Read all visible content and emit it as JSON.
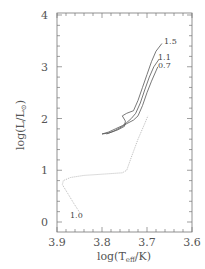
{
  "chart_data": {
    "type": "line",
    "title": "",
    "xlabel": "log(T_eff/K)",
    "ylabel": "log(L/L_sun)",
    "xlim": [
      3.9,
      3.6
    ],
    "ylim": [
      0,
      4
    ],
    "x_reversed": true,
    "grid": false,
    "x_ticks": [
      3.9,
      3.8,
      3.7,
      3.6
    ],
    "x_tick_labels": [
      "3.9",
      "3.8",
      "3.7",
      "3.6"
    ],
    "y_ticks": [
      0,
      1,
      2,
      3,
      4
    ],
    "y_tick_labels": [
      "0",
      "1",
      "2",
      "3",
      "4"
    ],
    "series": [
      {
        "name": "1.0",
        "style": "dotted",
        "color": "#bbbbbb",
        "x": [
          3.847,
          3.862,
          3.876,
          3.888,
          3.886,
          3.87,
          3.84,
          3.79,
          3.755,
          3.745,
          3.735,
          3.72,
          3.705,
          3.698
        ],
        "y": [
          0.15,
          0.35,
          0.55,
          0.72,
          0.8,
          0.86,
          0.9,
          0.93,
          0.95,
          1.0,
          1.25,
          1.6,
          1.9,
          2.05
        ]
      },
      {
        "name": "0.7",
        "style": "solid",
        "color": "#555555",
        "x": [
          3.79,
          3.775,
          3.76,
          3.745,
          3.73,
          3.72,
          3.71,
          3.7,
          3.69,
          3.68,
          3.676
        ],
        "y": [
          1.7,
          1.75,
          1.82,
          1.9,
          1.97,
          2.05,
          2.25,
          2.5,
          2.72,
          2.92,
          3.0
        ]
      },
      {
        "name": "1.1",
        "style": "solid",
        "color": "#555555",
        "x": [
          3.8,
          3.785,
          3.77,
          3.755,
          3.745,
          3.735,
          3.725,
          3.715,
          3.705,
          3.695,
          3.685,
          3.673
        ],
        "y": [
          1.7,
          1.74,
          1.8,
          1.86,
          1.92,
          2.0,
          2.1,
          2.3,
          2.55,
          2.8,
          3.0,
          3.15
        ]
      },
      {
        "name": "1.5",
        "style": "solid",
        "color": "#555555",
        "x": [
          3.8,
          3.785,
          3.765,
          3.75,
          3.748,
          3.755,
          3.745,
          3.73,
          3.72,
          3.71,
          3.7,
          3.69,
          3.68,
          3.667
        ],
        "y": [
          1.7,
          1.72,
          1.78,
          1.85,
          1.95,
          2.05,
          2.1,
          2.15,
          2.35,
          2.6,
          2.85,
          3.1,
          3.3,
          3.45
        ]
      }
    ],
    "annotations": [
      {
        "text": "1.5",
        "x": 3.662,
        "y": 3.48
      },
      {
        "text": "1.1",
        "x": 3.668,
        "y": 3.18
      },
      {
        "text": "0.7",
        "x": 3.669,
        "y": 2.98
      },
      {
        "text": "1.0",
        "x": 3.856,
        "y": 0.18
      }
    ]
  },
  "labels": {
    "x_axis": "log(T",
    "x_sub": "eff",
    "x_tail": "/K)",
    "y_axis": "log(L/L",
    "y_sub": "⊙",
    "y_tail": ")",
    "x_ticks": [
      "3.9",
      "3.8",
      "3.7",
      "3.6"
    ],
    "y_ticks": [
      "0",
      "1",
      "2",
      "3",
      "4"
    ],
    "curves": [
      "1.5",
      "1.1",
      "0.7",
      "1.0"
    ]
  }
}
